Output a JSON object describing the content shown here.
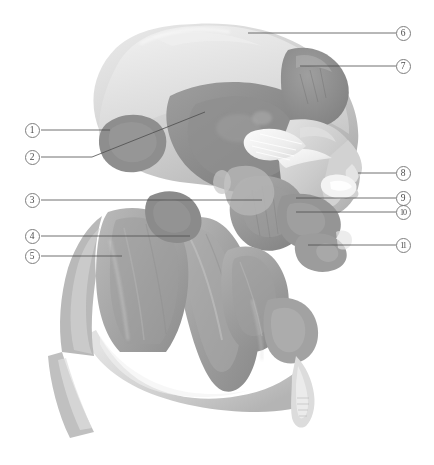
{
  "figure": {
    "background_color": "#ffffff",
    "width": 434,
    "height": 465,
    "view": "lateral",
    "render_style": "grayscale 3D volume rendering"
  },
  "leader_line": {
    "color": "#4d4d4d",
    "width": 0.8
  },
  "callouts": [
    {
      "id": "1",
      "label": "1",
      "side": "left",
      "cx": 32,
      "cy": 130,
      "line": [
        [
          41,
          130
        ],
        [
          110,
          130
        ]
      ]
    },
    {
      "id": "2",
      "label": "2",
      "side": "left",
      "cx": 32,
      "cy": 157,
      "line": [
        [
          41,
          157
        ],
        [
          92,
          157
        ],
        [
          205,
          112
        ]
      ]
    },
    {
      "id": "3",
      "label": "3",
      "side": "left",
      "cx": 32,
      "cy": 200,
      "line": [
        [
          41,
          200
        ],
        [
          262,
          200
        ]
      ]
    },
    {
      "id": "4",
      "label": "4",
      "side": "left",
      "cx": 32,
      "cy": 236,
      "line": [
        [
          41,
          236
        ],
        [
          190,
          236
        ]
      ]
    },
    {
      "id": "5",
      "label": "5",
      "side": "left",
      "cx": 32,
      "cy": 256,
      "line": [
        [
          41,
          256
        ],
        [
          122,
          256
        ]
      ]
    },
    {
      "id": "6",
      "label": "6",
      "side": "right",
      "cx": 403,
      "cy": 33,
      "line": [
        [
          396,
          33
        ],
        [
          248,
          33
        ]
      ]
    },
    {
      "id": "7",
      "label": "7",
      "side": "right",
      "cx": 403,
      "cy": 66,
      "line": [
        [
          396,
          66
        ],
        [
          300,
          66
        ]
      ]
    },
    {
      "id": "8",
      "label": "8",
      "side": "right",
      "cx": 403,
      "cy": 173,
      "line": [
        [
          396,
          173
        ],
        [
          358,
          173
        ]
      ]
    },
    {
      "id": "9",
      "label": "9",
      "side": "right",
      "cx": 403,
      "cy": 198,
      "line": [
        [
          396,
          198
        ],
        [
          296,
          198
        ]
      ]
    },
    {
      "id": "10",
      "label": "10",
      "side": "right",
      "cx": 403,
      "cy": 212,
      "line": [
        [
          396,
          212
        ],
        [
          296,
          212
        ]
      ]
    },
    {
      "id": "11",
      "label": "11",
      "side": "right",
      "cx": 403,
      "cy": 245,
      "line": [
        [
          396,
          245
        ],
        [
          308,
          245
        ]
      ]
    }
  ],
  "palette": {
    "skull_light": "#d9d9d9",
    "skull_mid": "#c2c2c2",
    "muscle_mid": "#a8a8a8",
    "muscle_dark": "#8a8a8a",
    "muscle_darker": "#787878",
    "tendon_white": "#f2f2f2",
    "highlight": "#ececec",
    "shadow": "#6e6e6e",
    "outline": "#7d7d7d"
  }
}
